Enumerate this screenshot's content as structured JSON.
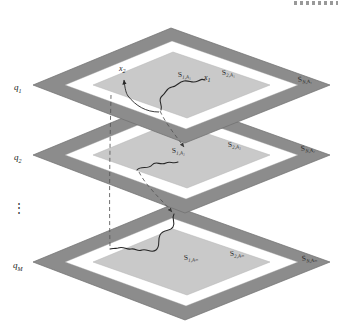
{
  "figure": {
    "background": "#ffffff",
    "colors": {
      "outer_band": "#8c8c8c",
      "outer_band_edge": "#6f6f6f",
      "middle_band": "#ffffff",
      "inner_region": "#c9c9c9",
      "inner_region_edge": "#b4b4b4",
      "curve": "#262626",
      "dashed": "#555555",
      "text": "#1a1a1a"
    },
    "top_artifact": "dotted-artifact"
  },
  "planes": [
    {
      "id": "plane-1",
      "axis_label": "q",
      "axis_sub": "1",
      "cy": 85,
      "labels": [
        {
          "name": "region-1",
          "base": "S",
          "sub": "1,A₁",
          "x": 178,
          "y": 77
        },
        {
          "name": "region-2",
          "base": "S",
          "sub": "2,A₁",
          "x": 222,
          "y": 75
        },
        {
          "name": "region-N",
          "base": "S",
          "sub": "N,A₁",
          "x": 300,
          "y": 81
        }
      ],
      "points": [
        {
          "name": "point-x2",
          "base": "x",
          "sub": "2",
          "x": 122,
          "y": 71
        },
        {
          "name": "point-x1",
          "base": "x",
          "sub": "1",
          "x": 206,
          "y": 80
        }
      ]
    },
    {
      "id": "plane-2",
      "axis_label": "q",
      "axis_sub": "2",
      "cy": 155,
      "labels": [
        {
          "name": "region-1",
          "base": "S",
          "sub": "1,A₂",
          "x": 175,
          "y": 152
        },
        {
          "name": "region-2",
          "base": "S",
          "sub": "2,A₂",
          "x": 228,
          "y": 146
        },
        {
          "name": "region-N",
          "base": "S",
          "sub": "N,A₂",
          "x": 303,
          "y": 150
        }
      ],
      "points": []
    },
    {
      "id": "plane-M",
      "axis_label": "q",
      "axis_sub": "M",
      "cy": 262,
      "labels": [
        {
          "name": "region-1",
          "base": "S",
          "sub": "1,Aₘ",
          "x": 186,
          "y": 259
        },
        {
          "name": "region-2",
          "base": "S",
          "sub": "2,Aₘ",
          "x": 231,
          "y": 255
        },
        {
          "name": "region-N",
          "base": "S",
          "sub": "N,Aₘ",
          "x": 304,
          "y": 260
        }
      ],
      "points": []
    }
  ],
  "ellipsis": {
    "name": "vertical-ellipsis",
    "glyph": "⋮",
    "x": 16,
    "y": 208
  }
}
